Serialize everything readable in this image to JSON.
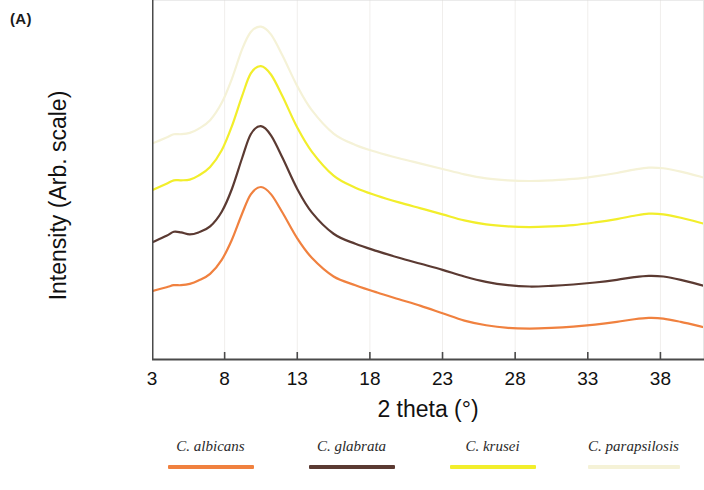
{
  "panel": {
    "label": "(A)"
  },
  "axes": {
    "xlabel": "2 theta (°)",
    "ylabel": "Intensity (Arb. scale)",
    "xticks": [
      "3",
      "8",
      "13",
      "18",
      "23",
      "28",
      "33",
      "38"
    ]
  },
  "legend": {
    "items": [
      {
        "label": "C. albicans",
        "color": "#F0813F"
      },
      {
        "label": "C. glabrata",
        "color": "#5B3A32"
      },
      {
        "label": "C. krusei",
        "color": "#F2EE2B"
      },
      {
        "label": "C. parapsilosis",
        "color": "#F5F2D7"
      }
    ]
  },
  "chart_data": {
    "type": "line",
    "title": "",
    "xlabel": "2 theta (°)",
    "ylabel": "Intensity (Arb. scale)",
    "xlim": [
      3,
      41
    ],
    "ylim": [
      0,
      1
    ],
    "grid": true,
    "legend_position": "bottom",
    "note": "Stacked XRD diffractograms of four Candida species; broad amorphous peak near 2 theta = 10.5 deg with a weak shoulder near 5 deg and a broad secondary hump near 36-38 deg. Y values are arbitrary offset intensity units.",
    "x": [
      3,
      4,
      4.5,
      5,
      5.6,
      6.2,
      7,
      7.8,
      8.5,
      9.2,
      9.8,
      10.5,
      11.2,
      12,
      13,
      14,
      15.5,
      17,
      18.5,
      20,
      21.5,
      23,
      24.5,
      26,
      27.5,
      29,
      30.5,
      32,
      33.5,
      35,
      36.2,
      37.2,
      38.2,
      39.4,
      41
    ],
    "series": [
      {
        "name": "C. albicans",
        "color": "#F0813F",
        "values": [
          0.206,
          0.218,
          0.224,
          0.224,
          0.228,
          0.238,
          0.258,
          0.3,
          0.36,
          0.438,
          0.496,
          0.518,
          0.496,
          0.44,
          0.364,
          0.306,
          0.25,
          0.224,
          0.202,
          0.182,
          0.162,
          0.14,
          0.118,
          0.104,
          0.096,
          0.094,
          0.096,
          0.1,
          0.106,
          0.114,
          0.122,
          0.126,
          0.124,
          0.114,
          0.098
        ]
      },
      {
        "name": "C. glabrata",
        "color": "#5B3A32",
        "values": [
          0.352,
          0.372,
          0.384,
          0.382,
          0.376,
          0.382,
          0.4,
          0.444,
          0.512,
          0.604,
          0.676,
          0.7,
          0.672,
          0.604,
          0.512,
          0.442,
          0.378,
          0.348,
          0.326,
          0.306,
          0.288,
          0.27,
          0.25,
          0.234,
          0.224,
          0.22,
          0.222,
          0.226,
          0.232,
          0.24,
          0.248,
          0.252,
          0.25,
          0.24,
          0.222
        ]
      },
      {
        "name": "C. krusei",
        "color": "#F2EE2B",
        "values": [
          0.508,
          0.528,
          0.538,
          0.538,
          0.54,
          0.552,
          0.578,
          0.628,
          0.7,
          0.79,
          0.858,
          0.88,
          0.854,
          0.788,
          0.696,
          0.624,
          0.552,
          0.516,
          0.492,
          0.472,
          0.454,
          0.436,
          0.418,
          0.406,
          0.4,
          0.398,
          0.4,
          0.404,
          0.412,
          0.422,
          0.432,
          0.438,
          0.436,
          0.426,
          0.408
        ]
      },
      {
        "name": "C. parapsilosis",
        "color": "#F5F2D7",
        "values": [
          0.648,
          0.666,
          0.676,
          0.676,
          0.68,
          0.692,
          0.718,
          0.77,
          0.842,
          0.93,
          0.982,
          0.998,
          0.974,
          0.91,
          0.82,
          0.748,
          0.678,
          0.644,
          0.622,
          0.604,
          0.588,
          0.572,
          0.556,
          0.544,
          0.538,
          0.536,
          0.538,
          0.542,
          0.55,
          0.56,
          0.57,
          0.576,
          0.574,
          0.564,
          0.546
        ]
      }
    ]
  }
}
